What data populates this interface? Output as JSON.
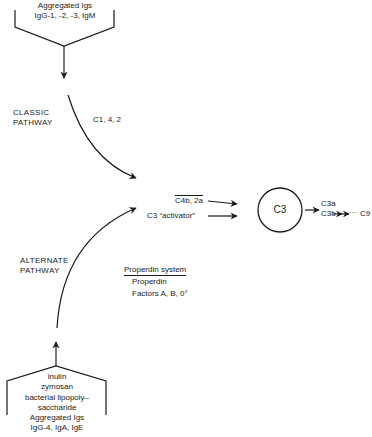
{
  "diagram": {
    "classic_source": {
      "line1": "Aggregated Igs",
      "line2": "IgG-1, -2, -3, IgM"
    },
    "classic_pathway": {
      "label_line1": "CLASSIC",
      "label_line2": "PATHWAY",
      "components": "C1, 4, 2"
    },
    "inputs": {
      "c4b2a_part1": "C4b, 2a",
      "activator": "C3 “activator”"
    },
    "center_node": {
      "label": "C3"
    },
    "products": {
      "c3a": "C3a",
      "c3b": "C3b",
      "terminal": "C9",
      "ellipsis": "···"
    },
    "alternate_pathway": {
      "label_line1": "ALTERNATE",
      "label_line2": "PATHWAY",
      "system_heading": "Properdin system",
      "system_item1": "Properdin",
      "system_item2": "Factors A, B, 0°"
    },
    "alternate_source": {
      "lines": [
        "inulin",
        "zymosan",
        "bacterial lipopoly–",
        "saccharide",
        "Aggregated Igs",
        "IgG-4, IgA, IgE"
      ]
    }
  }
}
